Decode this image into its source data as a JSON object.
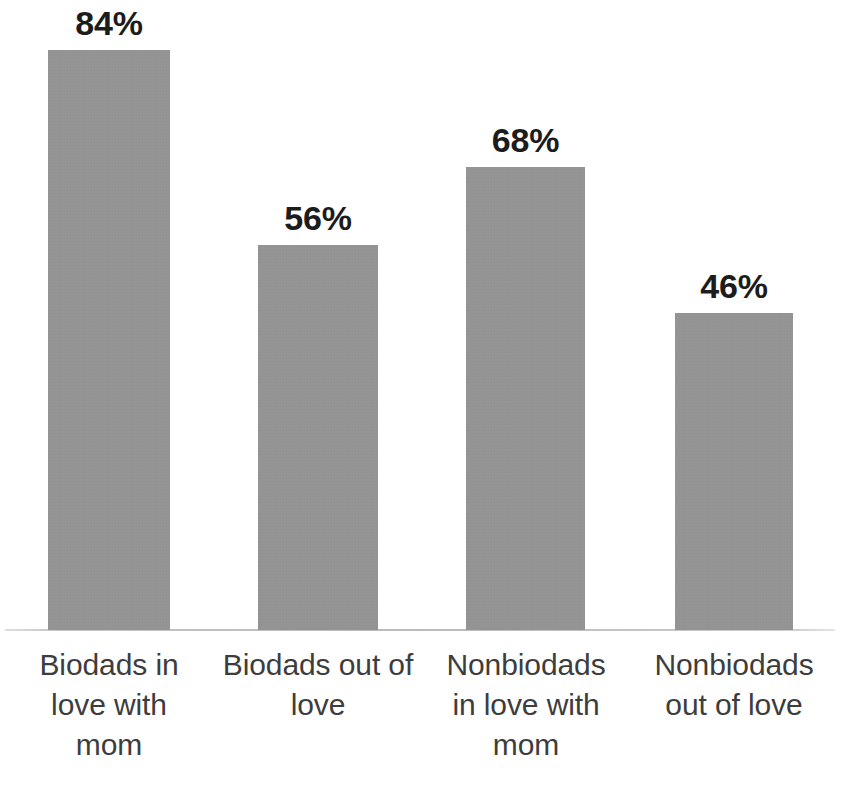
{
  "chart_data": {
    "type": "bar",
    "title": "",
    "subtitle": "",
    "xlabel": "",
    "ylabel": "",
    "categories": [
      "Biodads in love with mom",
      "Biodads out of love",
      "Nonbiodads in love with mom",
      "Nonbiodads out of love"
    ],
    "category_lines": [
      [
        "Biodads in",
        "love with",
        "mom"
      ],
      [
        "Biodads out of",
        "love"
      ],
      [
        "Nonbiodads",
        "in love with",
        "mom"
      ],
      [
        "Nonbiodads",
        "out of love"
      ]
    ],
    "values": [
      84,
      56,
      68,
      46
    ],
    "value_labels": [
      "84%",
      "56%",
      "68%",
      "46%"
    ],
    "unit": "%",
    "ylim": [
      0,
      100
    ],
    "grid": false,
    "legend": false,
    "legend_position": "none",
    "series": [
      {
        "name": "",
        "values": [
          84,
          56,
          68,
          46
        ]
      }
    ]
  },
  "style": {
    "bar_color": "#979797",
    "background_color": "#ffffff",
    "value_label_color": "#1c1c1c",
    "category_label_color": "#3d3d3d",
    "axis_line_color": "#969696"
  },
  "geometry": {
    "baseline_y": 630,
    "pixels_per_unit": 6.9,
    "bars": [
      {
        "left": 48,
        "width": 122,
        "top": 50,
        "height": 580
      },
      {
        "left": 258,
        "width": 120,
        "top": 245,
        "height": 385
      },
      {
        "left": 466,
        "width": 119,
        "top": 167,
        "height": 463
      },
      {
        "left": 675,
        "width": 118,
        "top": 313,
        "height": 317
      }
    ],
    "label_columns": [
      {
        "left": 10,
        "width": 198
      },
      {
        "left": 218,
        "width": 200
      },
      {
        "left": 424,
        "width": 204
      },
      {
        "left": 634,
        "width": 200
      }
    ]
  }
}
